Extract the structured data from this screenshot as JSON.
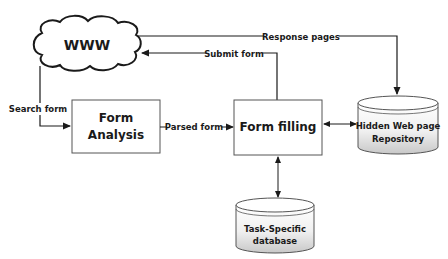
{
  "diagram": {
    "nodes": {
      "www": {
        "label": "WWW",
        "shape": "cloud"
      },
      "form_analysis": {
        "label_line1": "Form",
        "label_line2": "Analysis",
        "shape": "rectangle"
      },
      "form_filling": {
        "label": "Form filling",
        "shape": "rectangle"
      },
      "hidden_repo": {
        "label_line1": "Hidden Web page",
        "label_line2": "Repository",
        "shape": "cylinder"
      },
      "task_db": {
        "label_line1": "Task-Specific",
        "label_line2": "database",
        "shape": "cylinder"
      }
    },
    "edges": {
      "search_form": {
        "label": "Search form",
        "from": "WWW",
        "to": "Form Analysis"
      },
      "parsed_form": {
        "label": "Parsed form",
        "from": "Form Analysis",
        "to": "Form filling"
      },
      "submit_form": {
        "label": "Submit form",
        "from": "Form filling",
        "to": "WWW"
      },
      "response_pages": {
        "label": "Response pages",
        "from": "WWW",
        "to": "Hidden Web page Repository"
      },
      "filling_repo": {
        "label": "",
        "from": "Form filling",
        "to": "Hidden Web page Repository",
        "bidirectional": true
      },
      "filling_db": {
        "label": "",
        "from": "Form filling",
        "to": "Task-Specific database",
        "bidirectional": true
      }
    },
    "colors": {
      "line": "#1a1a1a",
      "box_fill": "#ffffff",
      "cylinder_fill_top": "#ffffff",
      "cylinder_fill_bottom": "#d9d9d9"
    }
  }
}
